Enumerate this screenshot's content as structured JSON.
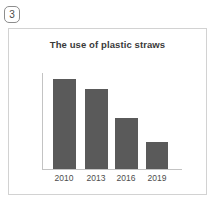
{
  "marker": {
    "label": "3",
    "name": "circled-number-3"
  },
  "card": {
    "border_color": "#d2d2d2",
    "background_color": "#ffffff"
  },
  "chart_data": {
    "type": "bar",
    "title": "The use of plastic straws",
    "xlabel": "",
    "ylabel": "",
    "categories": [
      "2010",
      "2013",
      "2016",
      "2019"
    ],
    "values": [
      100,
      89,
      57,
      30
    ],
    "ylim": [
      0,
      100
    ],
    "grid": false,
    "legend": false,
    "bar_color": "#5a5a5a",
    "axis_color": "#c3c3c3",
    "title_color": "#3a3a3a",
    "tick_label_color": "#4d4d4d",
    "bars": [
      {
        "category": "2010",
        "value": 100,
        "left_px": 11,
        "width_px": 23,
        "height_px": 90
      },
      {
        "category": "2013",
        "value": 89,
        "left_px": 43,
        "width_px": 23,
        "height_px": 80
      },
      {
        "category": "2016",
        "value": 57,
        "left_px": 73,
        "width_px": 23,
        "height_px": 51
      },
      {
        "category": "2019",
        "value": 30,
        "left_px": 104,
        "width_px": 22,
        "height_px": 27
      }
    ],
    "tick_positions_px": [
      5,
      37,
      67,
      98
    ]
  }
}
